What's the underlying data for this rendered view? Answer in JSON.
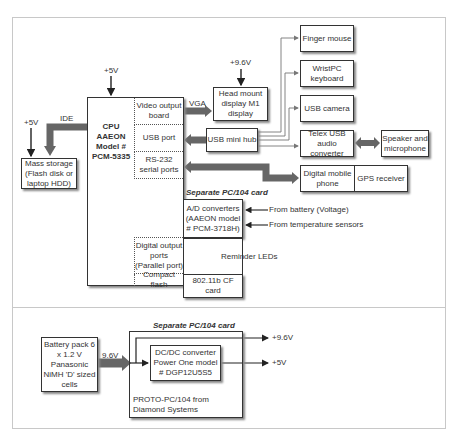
{
  "diagram": {
    "cpu": {
      "lines": [
        "CPU",
        "AAEON",
        "Model #",
        "PCM-5335"
      ]
    },
    "cpu_ports": [
      {
        "label": "Video output board"
      },
      {
        "label": "USB port"
      },
      {
        "label": "RS-232 serial ports"
      },
      {
        "label": "Digital output ports (Parallel port)"
      },
      {
        "label": "Compact flash"
      }
    ],
    "power_labels": {
      "cpu_5v": "+5V",
      "storage_5v": "+5V",
      "hmd_9v6": "+9.6V",
      "out_9v6": "+9.6V",
      "out_5v": "+5V",
      "battery_9v6": "9.6V"
    },
    "connection_labels": {
      "ide": "IDE",
      "vga": "VGA"
    },
    "mass_storage": {
      "label": "Mass storage (Flash disk or laptop HDD)"
    },
    "head_mount_display": {
      "label": "Head mount display M1 display"
    },
    "usb_hub": {
      "label": "USB mini hub"
    },
    "usb_devices": [
      {
        "label": "Finger mouse"
      },
      {
        "label": "WristPC keyboard"
      },
      {
        "label": "USB camera"
      },
      {
        "label": "Telex USB audio converter"
      }
    ],
    "speaker_mic": {
      "label": "Speaker and microphone"
    },
    "serial_devices": [
      {
        "label": "Digital mobile phone"
      },
      {
        "label": "GPS receiver"
      }
    ],
    "pc104_card_top": {
      "title": "Separate PC/104 card"
    },
    "ad_converter": {
      "label": "A/D converters (AAEON model # PCM-3718H)"
    },
    "ad_inputs": [
      {
        "label": "From battery (Voltage)"
      },
      {
        "label": "From temperature sensors"
      }
    ],
    "reminder_leds": {
      "label": "Reminder LEDs"
    },
    "cf_card": {
      "label": "802.11b CF card"
    },
    "battery": {
      "label": "Battery pack 6 x 1.2 V Panasonic NiMH 'D' sized cells"
    },
    "pc104_card_bottom": {
      "title": "Separate PC/104 card",
      "footer": "PROTO-PC/104 from Diamond Systems"
    },
    "dcdc": {
      "label": "DC/DC converter Power One model # DGP12U5S5"
    }
  }
}
